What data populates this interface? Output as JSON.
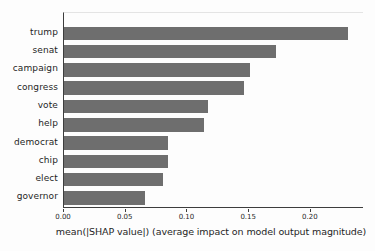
{
  "chart_data": {
    "type": "bar",
    "orientation": "horizontal",
    "title": "",
    "categories": [
      "trump",
      "senat",
      "campaign",
      "congress",
      "vote",
      "help",
      "democrat",
      "chip",
      "elect",
      "governor"
    ],
    "values": [
      0.23,
      0.172,
      0.151,
      0.146,
      0.117,
      0.113,
      0.084,
      0.084,
      0.08,
      0.066
    ],
    "xlabel": "mean(|SHAP value|) (average impact on model output magnitude)",
    "ylabel": "",
    "xticks": [
      0.0,
      0.05,
      0.1,
      0.15,
      0.2
    ],
    "xtick_labels": [
      "0.00",
      "0.05",
      "0.10",
      "0.15",
      "0.20"
    ],
    "xlim": [
      0,
      0.243
    ],
    "grid": false,
    "legend": null,
    "bar_color": "#6e6e6e",
    "axis_color": "#3d3d3d",
    "text_color": "#1f1f1f"
  }
}
